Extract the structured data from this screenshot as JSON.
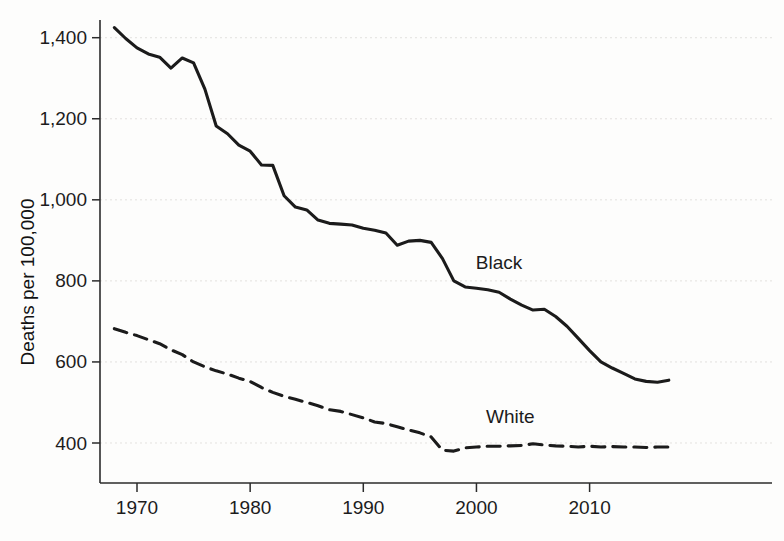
{
  "chart_data": {
    "type": "line",
    "title": "",
    "subtitle": "",
    "xlabel": "",
    "ylabel": "Deaths per 100,000",
    "xlim": [
      1968,
      2017
    ],
    "ylim": [
      340,
      1460
    ],
    "grid": true,
    "grid_axis": "y",
    "legend_position": "inline-annotation",
    "x_ticks": [
      1970,
      1980,
      1990,
      2000,
      2010
    ],
    "x_tick_labels": [
      "1970",
      "1980",
      "1990",
      "2000",
      "2010"
    ],
    "y_ticks": [
      400,
      600,
      800,
      1000,
      1200,
      1400
    ],
    "y_tick_labels": [
      "400",
      "600",
      "800",
      "1,000",
      "1,200",
      "1,400"
    ],
    "x": [
      1968,
      1969,
      1970,
      1971,
      1972,
      1973,
      1974,
      1975,
      1976,
      1977,
      1978,
      1979,
      1980,
      1981,
      1982,
      1983,
      1984,
      1985,
      1986,
      1987,
      1988,
      1989,
      1990,
      1991,
      1992,
      1993,
      1994,
      1995,
      1996,
      1997,
      1998,
      1999,
      2000,
      2001,
      2002,
      2003,
      2004,
      2005,
      2006,
      2007,
      2008,
      2009,
      2010,
      2011,
      2012,
      2013,
      2014,
      2015,
      2016,
      2017
    ],
    "series": [
      {
        "name": "Black",
        "style": "solid",
        "color": "#1b1b1b",
        "label_x": 2002,
        "label_y": 830,
        "values": [
          1425,
          1398,
          1375,
          1360,
          1352,
          1325,
          1350,
          1338,
          1273,
          1182,
          1163,
          1135,
          1120,
          1086,
          1085,
          1010,
          982,
          975,
          950,
          942,
          940,
          938,
          930,
          925,
          918,
          888,
          898,
          900,
          895,
          855,
          800,
          785,
          782,
          778,
          772,
          755,
          740,
          728,
          730,
          712,
          688,
          658,
          628,
          600,
          585,
          572,
          558,
          552,
          550,
          555
        ]
      },
      {
        "name": "White",
        "style": "dashed",
        "color": "#1b1b1b",
        "label_x": 2003,
        "label_y": 450,
        "values": [
          682,
          673,
          665,
          655,
          645,
          630,
          618,
          600,
          588,
          578,
          570,
          560,
          552,
          537,
          525,
          515,
          508,
          500,
          492,
          482,
          478,
          470,
          462,
          452,
          448,
          440,
          432,
          425,
          415,
          382,
          380,
          388,
          390,
          392,
          392,
          393,
          394,
          398,
          395,
          393,
          392,
          390,
          392,
          390,
          391,
          390,
          390,
          389,
          390,
          390
        ]
      }
    ]
  },
  "axes": {
    "y_axis_title": "Deaths per 100,000"
  }
}
